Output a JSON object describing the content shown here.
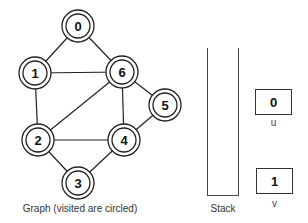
{
  "graph": {
    "caption": "Graph (visited are circled)",
    "nodes": [
      {
        "id": "0",
        "x": 78,
        "y": 26,
        "visited": true
      },
      {
        "id": "1",
        "x": 35,
        "y": 73,
        "visited": true
      },
      {
        "id": "6",
        "x": 122,
        "y": 72,
        "visited": true
      },
      {
        "id": "5",
        "x": 165,
        "y": 105,
        "visited": true
      },
      {
        "id": "2",
        "x": 38,
        "y": 140,
        "visited": true
      },
      {
        "id": "4",
        "x": 124,
        "y": 140,
        "visited": true
      },
      {
        "id": "3",
        "x": 78,
        "y": 183,
        "visited": true
      }
    ],
    "edges": [
      [
        "0",
        "1"
      ],
      [
        "0",
        "6"
      ],
      [
        "1",
        "6"
      ],
      [
        "1",
        "2"
      ],
      [
        "2",
        "6"
      ],
      [
        "2",
        "4"
      ],
      [
        "2",
        "3"
      ],
      [
        "3",
        "4"
      ],
      [
        "4",
        "6"
      ],
      [
        "4",
        "5"
      ],
      [
        "5",
        "6"
      ]
    ]
  },
  "stack": {
    "label": "Stack",
    "items": []
  },
  "variables": {
    "u": {
      "label": "u",
      "value": "0"
    },
    "v": {
      "label": "v",
      "value": "1"
    }
  }
}
